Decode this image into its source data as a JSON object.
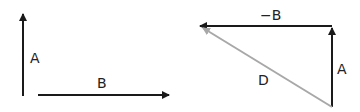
{
  "diagram": {
    "left": {
      "vector_a_label": "A",
      "vector_b_label": "B"
    },
    "right": {
      "vector_neg_b_label": "−B",
      "vector_a_label": "A",
      "vector_d_label": "D"
    },
    "colors": {
      "vector": "#1a1a1a",
      "resultant": "#a8a8a8"
    }
  }
}
